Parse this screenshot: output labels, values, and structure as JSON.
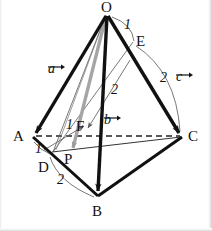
{
  "figure": {
    "background_color": "#ffffff",
    "ink_color": "#111111",
    "gray_color": "#9a9a9a",
    "vertices": [
      {
        "name": "O",
        "label": "O",
        "x": 107,
        "y": 14
      },
      {
        "name": "A",
        "label": "A",
        "x": 33,
        "y": 137
      },
      {
        "name": "B",
        "label": "B",
        "x": 98,
        "y": 196
      },
      {
        "name": "C",
        "label": "C",
        "x": 182,
        "y": 137
      },
      {
        "name": "D",
        "label": "D",
        "x": 52,
        "y": 152
      },
      {
        "name": "E",
        "label": "E",
        "x": 133,
        "y": 42
      },
      {
        "name": "F",
        "label": "F",
        "x": 88,
        "y": 134
      },
      {
        "name": "P",
        "label": "P",
        "x": 74,
        "y": 156
      }
    ],
    "vertex_labels": [
      {
        "name": "label-O",
        "text": "O",
        "x": 101,
        "y": 0
      },
      {
        "name": "label-A",
        "text": "A",
        "x": 13,
        "y": 129
      },
      {
        "name": "label-B",
        "text": "B",
        "x": 92,
        "y": 204
      },
      {
        "name": "label-C",
        "text": "C",
        "x": 188,
        "y": 129
      },
      {
        "name": "label-D",
        "text": "D",
        "x": 38,
        "y": 160
      },
      {
        "name": "label-E",
        "text": "E",
        "x": 136,
        "y": 34
      },
      {
        "name": "label-F",
        "text": "F",
        "x": 76,
        "y": 119
      },
      {
        "name": "label-P",
        "text": "P",
        "x": 64,
        "y": 152
      }
    ],
    "vectors": [
      {
        "name": "vector-a",
        "label": "a",
        "x": 55,
        "y": 56,
        "from": "O",
        "to": "A"
      },
      {
        "name": "vector-b",
        "label": "b",
        "x": 106,
        "y": 110,
        "from": "O",
        "to": "B"
      },
      {
        "name": "vector-c",
        "label": "c",
        "x": 178,
        "y": 68,
        "from": "O",
        "to": "C"
      }
    ],
    "ratio_labels": [
      {
        "name": "ratio-OE",
        "text": "1",
        "x": 124,
        "y": 18,
        "segment": "O-E"
      },
      {
        "name": "ratio-EC",
        "text": "2",
        "x": 160,
        "y": 75,
        "segment": "E-C"
      },
      {
        "name": "ratio-AD",
        "text": "1",
        "x": 38,
        "y": 143,
        "segment": "A-D"
      },
      {
        "name": "ratio-DB",
        "text": "2",
        "x": 58,
        "y": 176,
        "segment": "D-B"
      },
      {
        "name": "ratio-OF",
        "text": "2",
        "x": 112,
        "y": 84,
        "segment": "O-F"
      },
      {
        "name": "ratio-FD",
        "text": "1",
        "x": 68,
        "y": 119,
        "segment": "F-D"
      }
    ],
    "dashed_segments": [
      {
        "name": "segment-AC",
        "from": "A",
        "to": "C"
      }
    ],
    "solid_edges": [
      {
        "name": "edge-OA",
        "from": "O",
        "to": "A"
      },
      {
        "name": "edge-OB",
        "from": "O",
        "to": "B"
      },
      {
        "name": "edge-OC",
        "from": "O",
        "to": "C"
      },
      {
        "name": "edge-AB",
        "from": "A",
        "to": "B"
      },
      {
        "name": "edge-BC",
        "from": "B",
        "to": "C"
      }
    ],
    "thin_lines": [
      {
        "name": "line-OD",
        "from": "O",
        "to": "D"
      },
      {
        "name": "line-ED",
        "from": "E",
        "to": "D"
      },
      {
        "name": "line-DC",
        "from": "D",
        "to": "C"
      },
      {
        "name": "line-OP-gray",
        "from": "O",
        "to": "P"
      }
    ]
  }
}
